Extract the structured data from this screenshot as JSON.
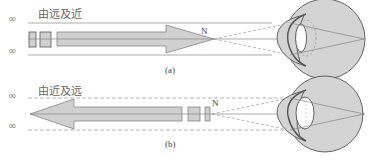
{
  "panel_a": {
    "infinity_top": "∞",
    "infinity_bottom": "∞",
    "direction_label": "由远及近",
    "point_label": "N",
    "caption": "(a)"
  },
  "panel_b": {
    "infinity_top": "∞",
    "infinity_bottom": "∞",
    "direction_label": "由近及远",
    "point_label": "N",
    "caption": "(b)"
  },
  "colors": {
    "fill": "#d0d0d0",
    "stroke": "#555555",
    "line": "#888888",
    "dashed": "#999999"
  }
}
